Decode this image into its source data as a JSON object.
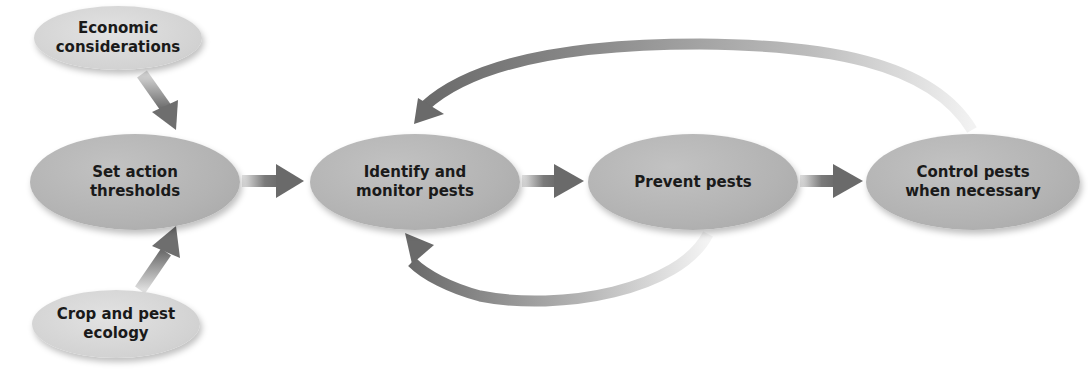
{
  "diagram": {
    "nodes": {
      "economic": {
        "label": "Economic\nconsiderations"
      },
      "ecology": {
        "label": "Crop and pest\necology"
      },
      "thresholds": {
        "label": "Set action\nthresholds"
      },
      "identify": {
        "label": "Identify and\nmonitor pests"
      },
      "prevent": {
        "label": "Prevent pests"
      },
      "control": {
        "label": "Control pests\nwhen necessary"
      }
    },
    "edges": [
      {
        "from": "Economic considerations",
        "to": "Set action thresholds"
      },
      {
        "from": "Crop and pest ecology",
        "to": "Set action thresholds"
      },
      {
        "from": "Set action thresholds",
        "to": "Identify and monitor pests"
      },
      {
        "from": "Identify and monitor pests",
        "to": "Prevent pests"
      },
      {
        "from": "Prevent pests",
        "to": "Control pests when necessary"
      },
      {
        "from": "Control pests when necessary",
        "to": "Identify and monitor pests"
      },
      {
        "from": "Prevent pests",
        "to": "Identify and monitor pests"
      }
    ],
    "colors": {
      "main_node": "#b3b3b3",
      "secondary_node": "#d4d4d4",
      "arrow": "#6e6e6e"
    }
  }
}
